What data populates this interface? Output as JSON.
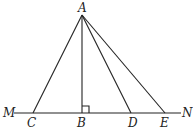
{
  "diagram": {
    "points": {
      "A": {
        "label": "A",
        "x": 82,
        "y": 15
      },
      "B": {
        "label": "B",
        "x": 82,
        "y": 113
      },
      "C": {
        "label": "C",
        "x": 33,
        "y": 113
      },
      "D": {
        "label": "D",
        "x": 131,
        "y": 113
      },
      "E": {
        "label": "E",
        "x": 165,
        "y": 113
      },
      "M": {
        "label": "M",
        "x": 14,
        "y": 113
      },
      "N": {
        "label": "N",
        "x": 181,
        "y": 113
      }
    },
    "segments": [
      "AC",
      "AB",
      "AD",
      "AE",
      "MN"
    ],
    "right_angle_at": "B",
    "line_color": "#222222"
  }
}
